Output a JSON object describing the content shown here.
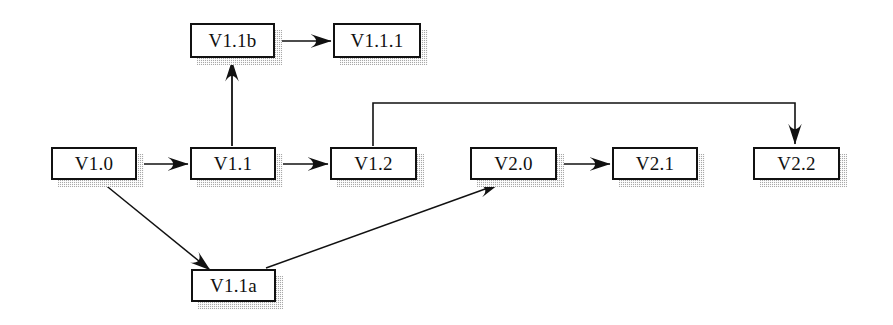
{
  "diagram": {
    "type": "directed-graph",
    "background_color": "#ffffff",
    "node_fill_color": "#ffffff",
    "node_border_color": "#111111",
    "shadow_color": "#a8a8a8",
    "edge_color": "#111111",
    "nodes": [
      {
        "id": "v1_1b",
        "label": "V1.1b",
        "x": 190,
        "y": 23,
        "w": 85,
        "h": 35
      },
      {
        "id": "v1_1_1",
        "label": "V1.1.1",
        "x": 333,
        "y": 23,
        "w": 88,
        "h": 35
      },
      {
        "id": "v1_0",
        "label": "V1.0",
        "x": 51,
        "y": 147,
        "w": 86,
        "h": 33
      },
      {
        "id": "v1_1",
        "label": "V1.1",
        "x": 190,
        "y": 147,
        "w": 86,
        "h": 33
      },
      {
        "id": "v1_2",
        "label": "V1.2",
        "x": 330,
        "y": 147,
        "w": 87,
        "h": 33
      },
      {
        "id": "v2_0",
        "label": "V2.0",
        "x": 470,
        "y": 147,
        "w": 87,
        "h": 33
      },
      {
        "id": "v2_1",
        "label": "V2.1",
        "x": 612,
        "y": 147,
        "w": 86,
        "h": 33
      },
      {
        "id": "v2_2",
        "label": "V2.2",
        "x": 753,
        "y": 147,
        "w": 87,
        "h": 33
      },
      {
        "id": "v1_1a",
        "label": "V1.1a",
        "x": 191,
        "y": 269,
        "w": 85,
        "h": 33
      }
    ],
    "edges": [
      {
        "id": "e_v1_1b_v1_1_1",
        "from": "v1_1b",
        "to": "v1_1_1",
        "shape": "straight"
      },
      {
        "id": "e_v1_1_v1_1b",
        "from": "v1_1",
        "to": "v1_1b",
        "shape": "straight"
      },
      {
        "id": "e_v1_0_v1_1",
        "from": "v1_0",
        "to": "v1_1",
        "shape": "straight"
      },
      {
        "id": "e_v1_1_v1_2",
        "from": "v1_1",
        "to": "v1_2",
        "shape": "straight"
      },
      {
        "id": "e_v2_0_v2_1",
        "from": "v2_0",
        "to": "v2_1",
        "shape": "straight"
      },
      {
        "id": "e_v1_2_v2_2",
        "from": "v1_2",
        "to": "v2_2",
        "shape": "orthogonal"
      },
      {
        "id": "e_v1_0_v1_1a",
        "from": "v1_0",
        "to": "v1_1a",
        "shape": "diagonal"
      },
      {
        "id": "e_v1_1a_v2_0",
        "from": "v1_1a",
        "to": "v2_0",
        "shape": "diagonal"
      }
    ]
  }
}
